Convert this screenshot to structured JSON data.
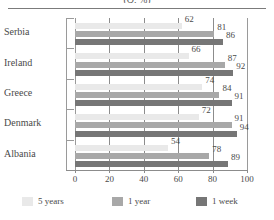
{
  "chart_data": {
    "type": "bar",
    "orientation": "horizontal",
    "title": "(Q, %)",
    "xlabel": "",
    "ylabel": "",
    "xlim": [
      0,
      100
    ],
    "xticks": [
      0,
      20,
      40,
      60,
      80,
      100
    ],
    "grid": true,
    "legend_position": "bottom",
    "categories": [
      "Serbia",
      "Ireland",
      "Greece",
      "Denmark",
      "Albania"
    ],
    "series": [
      {
        "name": "5 years",
        "color": "#e9e9e9",
        "values": [
          62,
          66,
          74,
          72,
          54
        ]
      },
      {
        "name": "1 year",
        "color": "#a8a8a8",
        "values": [
          81,
          87,
          84,
          91,
          78
        ]
      },
      {
        "name": "1 week",
        "color": "#767676",
        "values": [
          86,
          92,
          91,
          94,
          89
        ]
      }
    ]
  },
  "axis": {
    "tick_labels": [
      "0",
      "20",
      "40",
      "60",
      "80",
      "100"
    ]
  },
  "legend": {
    "items": [
      {
        "label": "5 years"
      },
      {
        "label": "1 year"
      },
      {
        "label": "1 week"
      }
    ]
  }
}
